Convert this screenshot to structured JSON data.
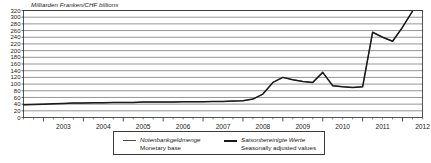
{
  "chart_data": {
    "type": "line",
    "title": "Milliarden Franken/CHF billions",
    "xlabel": "",
    "ylabel": "Milliarden Franken/CHF billions",
    "ylim": [
      0,
      320
    ],
    "xlim": [
      2002.5,
      2012.5
    ],
    "ytick_step": 20,
    "yticks": [
      0,
      20,
      40,
      60,
      80,
      100,
      120,
      140,
      160,
      180,
      200,
      220,
      240,
      260,
      280,
      300,
      320
    ],
    "categories": [
      "2003",
      "2004",
      "2005",
      "2006",
      "2007",
      "2008",
      "2009",
      "2010",
      "2011",
      "2012"
    ],
    "grid": true,
    "legend_position": "bottom",
    "minor_ticks_per_year": 4,
    "series": [
      {
        "name": "Notenbankgeldmenge / Monetary base",
        "style": "thin",
        "color": "#4a4a4a",
        "x": [
          2002.5,
          2002.75,
          2003.0,
          2003.25,
          2003.5,
          2003.75,
          2004.0,
          2004.25,
          2004.5,
          2004.75,
          2005.0,
          2005.25,
          2005.5,
          2005.75,
          2006.0,
          2006.25,
          2006.5,
          2006.75,
          2007.0,
          2007.25,
          2007.5,
          2007.75,
          2008.0,
          2008.25,
          2008.5,
          2008.75,
          2009.0,
          2009.25,
          2009.5,
          2009.75,
          2010.0,
          2010.25,
          2010.5,
          2010.75,
          2011.0,
          2011.25,
          2011.5,
          2011.75,
          2012.0,
          2012.25
        ],
        "values": [
          38,
          39,
          40,
          41,
          42,
          43,
          43,
          44,
          44,
          45,
          45,
          45,
          46,
          46,
          46,
          46,
          47,
          47,
          47,
          48,
          48,
          49,
          50,
          55,
          70,
          105,
          120,
          113,
          108,
          105,
          135,
          95,
          92,
          90,
          92,
          255,
          240,
          228,
          270,
          318
        ]
      },
      {
        "name": "Saisonbereinigte Werte / Seasonally adjusted values",
        "style": "thick",
        "color": "#1a1a1a",
        "x": [
          2002.5,
          2002.75,
          2003.0,
          2003.25,
          2003.5,
          2003.75,
          2004.0,
          2004.25,
          2004.5,
          2004.75,
          2005.0,
          2005.25,
          2005.5,
          2005.75,
          2006.0,
          2006.25,
          2006.5,
          2006.75,
          2007.0,
          2007.25,
          2007.5,
          2007.75,
          2008.0,
          2008.25,
          2008.5,
          2008.75,
          2009.0,
          2009.25,
          2009.5,
          2009.75,
          2010.0,
          2010.25,
          2010.5,
          2010.75,
          2011.0,
          2011.25,
          2011.5,
          2011.75,
          2012.0,
          2012.25
        ],
        "values": [
          38,
          39,
          40,
          41,
          42,
          43,
          43,
          44,
          44,
          45,
          45,
          45,
          46,
          46,
          46,
          46,
          47,
          47,
          47,
          48,
          48,
          49,
          50,
          55,
          70,
          105,
          120,
          113,
          108,
          105,
          135,
          95,
          92,
          90,
          92,
          255,
          240,
          228,
          270,
          318
        ]
      }
    ]
  },
  "legend": {
    "entries": [
      {
        "de": "Notenbankgeldmenge",
        "en": "Monetary base"
      },
      {
        "de": "Saisonbereinigte Werte",
        "en": "Seasonally adjusted values"
      }
    ]
  },
  "colors": {
    "line_thin": "#4a4a4a",
    "line_thick": "#1a1a1a",
    "grid": "#3a3a3a",
    "axis": "#2a2a2a",
    "background": "#ffffff"
  }
}
